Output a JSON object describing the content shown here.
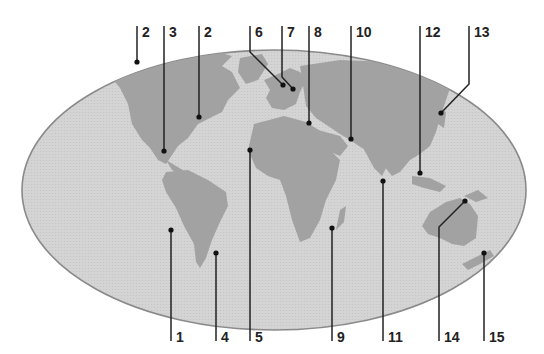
{
  "colors": {
    "ocean": "#d2d2d2",
    "land": "#a2a2a2",
    "outline": "#8a8a8a",
    "leader": "#222222",
    "label": "#222222",
    "background": "#ffffff"
  },
  "top_labels": [
    {
      "id": "2a",
      "text": "2",
      "x": 139,
      "dot": [
        132,
        62
      ],
      "bend": null
    },
    {
      "id": "3",
      "text": "3",
      "x": 166,
      "dot": [
        164,
        151
      ],
      "bend": null
    },
    {
      "id": "2b",
      "text": "2",
      "x": 200,
      "dot": [
        199,
        117
      ],
      "bend": null
    },
    {
      "id": "6",
      "text": "6",
      "x": 252,
      "dot": [
        283,
        85
      ],
      "bend": [
        250,
        52
      ]
    },
    {
      "id": "7",
      "text": "7",
      "x": 280,
      "dot": [
        293,
        89
      ],
      "bend": [
        282,
        77
      ]
    },
    {
      "id": "8",
      "text": "8",
      "x": 310,
      "dot": [
        309,
        123
      ],
      "bend": null
    },
    {
      "id": "10",
      "text": "10",
      "x": 352,
      "dot": [
        351,
        139
      ],
      "bend": null
    },
    {
      "id": "12",
      "text": "12",
      "x": 421,
      "dot": [
        420,
        173
      ],
      "bend": null
    },
    {
      "id": "13",
      "text": "13",
      "x": 469,
      "dot": [
        441,
        113
      ],
      "bend": [
        469,
        84
      ]
    }
  ],
  "bottom_labels": [
    {
      "id": "1",
      "text": "1",
      "x": 171,
      "dot": [
        171,
        230
      ]
    },
    {
      "id": "4",
      "text": "4",
      "x": 216,
      "dot": [
        216,
        253
      ]
    },
    {
      "id": "5",
      "text": "5",
      "x": 250,
      "dot": [
        250,
        150
      ]
    },
    {
      "id": "9",
      "text": "9",
      "x": 332,
      "dot": [
        332,
        228
      ]
    },
    {
      "id": "11",
      "text": "11",
      "x": 383,
      "dot": [
        383,
        181
      ]
    },
    {
      "id": "14",
      "text": "14",
      "x": 439,
      "dot": [
        465,
        201
      ],
      "bend": [
        439,
        227
      ]
    },
    {
      "id": "15",
      "text": "15",
      "x": 484,
      "dot": [
        484,
        253
      ]
    }
  ]
}
